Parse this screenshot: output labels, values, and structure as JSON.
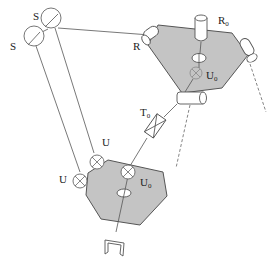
{
  "diagram": {
    "title": "",
    "type": "parallel-robot-mechanism",
    "labels": {
      "s_upper": "S",
      "s_lower": "S",
      "r": "R",
      "r0_main": "R",
      "r0_sub": "0",
      "u0_top_main": "U",
      "u0_top_sub": "0",
      "t0_main": "T",
      "t0_sub": "0",
      "u_upper": "U",
      "u_lower": "U",
      "u0_bottom_main": "U",
      "u0_bottom_sub": "0"
    },
    "colors": {
      "platform_fill": "#c4c4c4",
      "stroke": "#555555",
      "background": "#ffffff"
    },
    "components": [
      {
        "name": "fixed-base-platform",
        "shape": "hexagon"
      },
      {
        "name": "moving-platform",
        "shape": "hexagon"
      },
      {
        "name": "spherical-joint",
        "count": 2,
        "label": "S"
      },
      {
        "name": "revolute-joint",
        "count": 3,
        "label": "R"
      },
      {
        "name": "actuator-r0",
        "label": "R0"
      },
      {
        "name": "universal-joint",
        "count": 3,
        "label": "U"
      },
      {
        "name": "prismatic-joint",
        "label": "T0"
      },
      {
        "name": "gripper",
        "count": 1
      }
    ]
  }
}
